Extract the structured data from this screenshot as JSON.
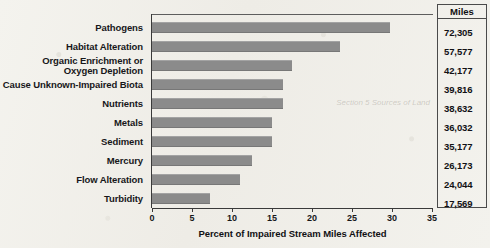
{
  "chart_data": {
    "type": "bar",
    "orientation": "horizontal",
    "title": "",
    "xlabel": "Percent of Impaired Stream Miles Affected",
    "ylabel": "",
    "xlim": [
      0,
      35
    ],
    "xticks": [
      0,
      5,
      10,
      15,
      20,
      25,
      30,
      35
    ],
    "xtick_labels": [
      "0",
      "5",
      "10",
      "15",
      "20",
      "25",
      "30",
      "35"
    ],
    "grid": false,
    "legend": false,
    "bar_color": "#8b8b8b",
    "categories": [
      "Pathogens",
      "Habitat Alteration",
      "Organic Enrichment or\nOxygen Depletion",
      "Cause Unknown-Impaired Biota",
      "Nutrients",
      "Metals",
      "Sediment",
      "Mercury",
      "Flow Alteration",
      "Turbidity"
    ],
    "values": [
      29.7,
      23.5,
      17.5,
      16.4,
      16.4,
      15.0,
      15.0,
      12.5,
      11.0,
      7.2
    ],
    "miles_header": "Miles",
    "miles": [
      "72,305",
      "57,577",
      "42,177",
      "39,816",
      "38,632",
      "36,032",
      "35,177",
      "26,173",
      "24,044",
      "17,569"
    ]
  },
  "bleed_through": "Section 5\nSources\nof Land"
}
